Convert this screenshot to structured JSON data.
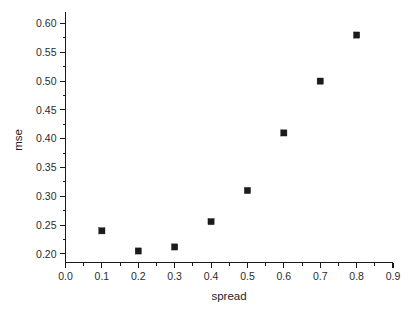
{
  "chart_data": {
    "type": "scatter",
    "title": "",
    "xlabel": "spread",
    "ylabel": "mse",
    "x": [
      0.1,
      0.2,
      0.3,
      0.4,
      0.5,
      0.6,
      0.7,
      0.8
    ],
    "values": [
      0.24,
      0.205,
      0.212,
      0.256,
      0.31,
      0.41,
      0.5,
      0.58
    ],
    "series": [
      {
        "name": "mse",
        "marker": "filled-square",
        "color": "#1b1b1b",
        "points": [
          {
            "x": 0.1,
            "y": 0.24
          },
          {
            "x": 0.2,
            "y": 0.205
          },
          {
            "x": 0.3,
            "y": 0.212
          },
          {
            "x": 0.4,
            "y": 0.256
          },
          {
            "x": 0.5,
            "y": 0.31
          },
          {
            "x": 0.6,
            "y": 0.41
          },
          {
            "x": 0.7,
            "y": 0.5
          },
          {
            "x": 0.8,
            "y": 0.58
          }
        ]
      }
    ],
    "xlim": [
      0.0,
      0.9
    ],
    "ylim": [
      0.185,
      0.62
    ],
    "xticks": [
      0.0,
      0.1,
      0.2,
      0.3,
      0.4,
      0.5,
      0.6,
      0.7,
      0.8,
      0.9
    ],
    "xtick_labels": [
      "0.0",
      "0.1",
      "0.2",
      "0.3",
      "0.4",
      "0.5",
      "0.6",
      "0.7",
      "0.8",
      "0.9"
    ],
    "yticks": [
      0.2,
      0.25,
      0.3,
      0.35,
      0.4,
      0.45,
      0.5,
      0.55,
      0.6
    ],
    "ytick_labels": [
      "0.20",
      "0.25",
      "0.30",
      "0.35",
      "0.40",
      "0.45",
      "0.50",
      "0.55",
      "0.60"
    ],
    "xminor_step": 0.05,
    "yminor_step": 0.025,
    "grid": false,
    "legend": false,
    "legend_position": "none",
    "axis_color": "#1a1a1a",
    "background_color": "#ffffff"
  },
  "axes": {
    "x_title": "spread",
    "y_title": "mse"
  }
}
